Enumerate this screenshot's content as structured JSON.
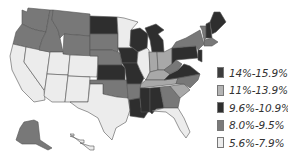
{
  "map": {
    "subject": "United States choropleth by state",
    "legend": [
      {
        "label": "14%-15.9%",
        "color": "#3c3c3c"
      },
      {
        "label": "11%-13.9%",
        "color": "#b4b4b4"
      },
      {
        "label": "9.6%-10.9%",
        "color": "#2e2e2e"
      },
      {
        "label": "8.0%-9.5%",
        "color": "#7a7a7a"
      },
      {
        "label": "5.6%-7.9%",
        "color": "#ececec"
      }
    ],
    "class_colors": {
      "c14": "#3c3c3c",
      "c11": "#a8a8a8",
      "c96": "#2e2e2e",
      "c80": "#787878",
      "c56": "#ececec"
    },
    "states": {
      "WA": "c80",
      "OR": "c80",
      "CA": "c56",
      "ID": "c80",
      "NV": "c56",
      "MT": "c80",
      "WY": "c80",
      "UT": "c56",
      "AZ": "c56",
      "CO": "c56",
      "NM": "c56",
      "ND": "c96",
      "SD": "c80",
      "NE": "c80",
      "KS": "c96",
      "OK": "c80",
      "TX": "c56",
      "MN": "c56",
      "IA": "c96",
      "MO": "c96",
      "AR": "c80",
      "LA": "c96",
      "WI": "c96",
      "IL": "c56",
      "MI": "c96",
      "IN": "c11",
      "OH": "c11",
      "KY": "c11",
      "TN": "c11",
      "MS": "c96",
      "AL": "c96",
      "GA": "c80",
      "FL": "c56",
      "SC": "c11",
      "NC": "c80",
      "VA": "c96",
      "WV": "c80",
      "PA": "c96",
      "NY": "c80",
      "ME": "c96",
      "VT": "c80",
      "NH": "c96",
      "MA": "c80",
      "NJ": "c96",
      "AK": "c80",
      "HI": "c56"
    }
  }
}
